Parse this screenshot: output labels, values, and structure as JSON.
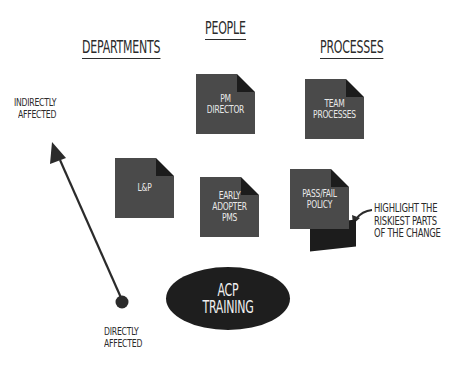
{
  "headings": {
    "people": "PEOPLE",
    "departments": "DEPARTMENTS",
    "processes": "PROCESSES"
  },
  "documents": [
    {
      "id": "pm-director",
      "lines": [
        "PM",
        "DIRECTOR"
      ],
      "category": "people"
    },
    {
      "id": "team-processes",
      "lines": [
        "TEAM",
        "PROCESSES"
      ],
      "category": "processes"
    },
    {
      "id": "l-and-p",
      "lines": [
        "L&P"
      ],
      "category": "departments"
    },
    {
      "id": "early-adopter-pms",
      "lines": [
        "EARLY",
        "ADOPTER",
        "PMS"
      ],
      "category": "people"
    },
    {
      "id": "pass-fail-policy",
      "lines": [
        "PASS/FAIL",
        "POLICY"
      ],
      "category": "processes"
    }
  ],
  "center": {
    "lines": [
      "ACP",
      "TRAINING"
    ]
  },
  "axis": {
    "top_label": [
      "INDIRECTLY",
      "AFFECTED"
    ],
    "bottom_label": [
      "DIRECTLY",
      "AFFECTED"
    ]
  },
  "annotation": {
    "lines": [
      "HIGHLIGHT THE",
      "RISKIEST PARTS",
      "OF THE CHANGE"
    ]
  },
  "colors": {
    "doc_fill": "#4a4a4a",
    "doc_fold": "#1c1c1c",
    "ellipse_fill": "#1e1e1e",
    "ink": "#2b2b2b",
    "background": "#ffffff"
  }
}
